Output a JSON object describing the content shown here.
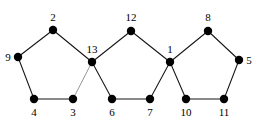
{
  "figure": {
    "background_color": "#ffffff",
    "node_color": "#000000",
    "edge_color": "#151515",
    "faint_edge_color": "#8a8a8a",
    "width": 256,
    "height": 123
  },
  "chart_data": {
    "type": "diagram",
    "subtype": "undirected-graph",
    "node_count": 13,
    "edge_count": 15,
    "nodes": [
      {
        "id": "2",
        "label": "2",
        "x": 53,
        "y": 30,
        "label_x": 53,
        "label_y": 21,
        "label_pos": "above"
      },
      {
        "id": "9",
        "label": "9",
        "x": 18,
        "y": 57,
        "label_x": 8,
        "label_y": 61,
        "label_pos": "left"
      },
      {
        "id": "4",
        "label": "4",
        "x": 34,
        "y": 99,
        "label_x": 34,
        "label_y": 116,
        "label_pos": "below"
      },
      {
        "id": "3",
        "label": "3",
        "x": 73,
        "y": 99,
        "label_x": 73,
        "label_y": 116,
        "label_pos": "below"
      },
      {
        "id": "13",
        "label": "13",
        "x": 92,
        "y": 62,
        "label_x": 92,
        "label_y": 53,
        "label_pos": "above"
      },
      {
        "id": "12",
        "label": "12",
        "x": 131,
        "y": 31,
        "label_x": 131,
        "label_y": 21,
        "label_pos": "above"
      },
      {
        "id": "6",
        "label": "6",
        "x": 112,
        "y": 99,
        "label_x": 112,
        "label_y": 116,
        "label_pos": "below"
      },
      {
        "id": "7",
        "label": "7",
        "x": 150,
        "y": 99,
        "label_x": 150,
        "label_y": 116,
        "label_pos": "below"
      },
      {
        "id": "1",
        "label": "1",
        "x": 170,
        "y": 62,
        "label_x": 170,
        "label_y": 53,
        "label_pos": "above"
      },
      {
        "id": "8",
        "label": "8",
        "x": 208,
        "y": 31,
        "label_x": 208,
        "label_y": 21,
        "label_pos": "above"
      },
      {
        "id": "5",
        "label": "5",
        "x": 239,
        "y": 60,
        "label_x": 249,
        "label_y": 64,
        "label_pos": "right"
      },
      {
        "id": "10",
        "label": "10",
        "x": 186,
        "y": 99,
        "label_x": 186,
        "label_y": 116,
        "label_pos": "below"
      },
      {
        "id": "11",
        "label": "11",
        "x": 224,
        "y": 99,
        "label_x": 224,
        "label_y": 116,
        "label_pos": "below"
      }
    ],
    "edges": [
      {
        "from": "2",
        "to": "9",
        "style": "solid"
      },
      {
        "from": "2",
        "to": "13",
        "style": "solid"
      },
      {
        "from": "9",
        "to": "4",
        "style": "solid"
      },
      {
        "from": "4",
        "to": "3",
        "style": "solid"
      },
      {
        "from": "3",
        "to": "13",
        "style": "faint"
      },
      {
        "from": "13",
        "to": "12",
        "style": "solid"
      },
      {
        "from": "13",
        "to": "6",
        "style": "solid"
      },
      {
        "from": "6",
        "to": "7",
        "style": "solid"
      },
      {
        "from": "7",
        "to": "1",
        "style": "solid"
      },
      {
        "from": "12",
        "to": "1",
        "style": "solid"
      },
      {
        "from": "1",
        "to": "8",
        "style": "solid"
      },
      {
        "from": "1",
        "to": "10",
        "style": "solid"
      },
      {
        "from": "8",
        "to": "5",
        "style": "solid"
      },
      {
        "from": "5",
        "to": "11",
        "style": "solid"
      },
      {
        "from": "10",
        "to": "11",
        "style": "solid"
      }
    ],
    "node_radius": 4.2
  }
}
